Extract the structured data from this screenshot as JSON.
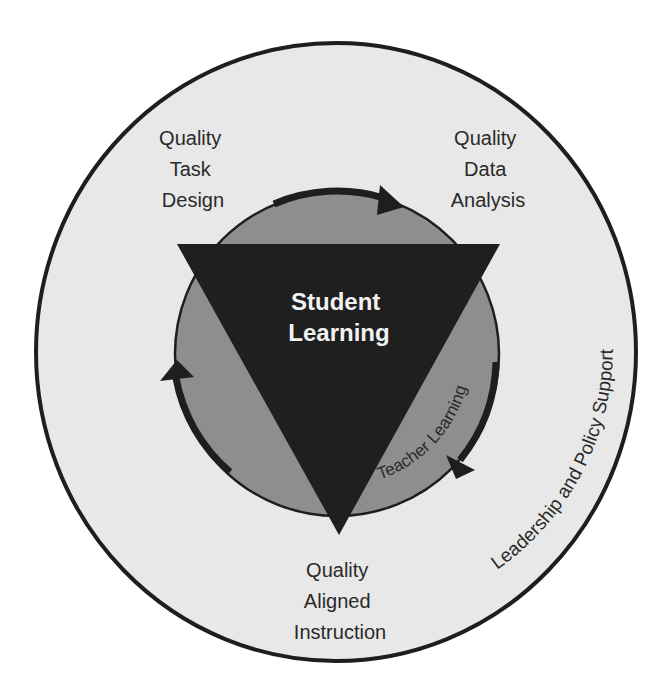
{
  "diagram": {
    "outer_ring": {
      "label": "Leadership and Policy Support",
      "fill": "#e8e8e8",
      "stroke": "#1e1e1e"
    },
    "inner_circle": {
      "label": "Teacher Learning",
      "fill": "#8e8e8e",
      "stroke": "#1e1e1e"
    },
    "center": {
      "line1": "Student",
      "line2": "Learning",
      "fill": "#1f1f1f",
      "text_color": "#f2f2f2"
    },
    "nodes": {
      "top_left": {
        "line1": "Quality",
        "line2": "Task",
        "line3": "Design"
      },
      "top_right": {
        "line1": "Quality",
        "line2": "Data",
        "line3": "Analysis"
      },
      "bottom": {
        "line1": "Quality",
        "line2": "Aligned",
        "line3": "Instruction"
      }
    },
    "cycle_arrows": {
      "count": 3,
      "direction": "clockwise",
      "color": "#1e1e1e"
    }
  }
}
